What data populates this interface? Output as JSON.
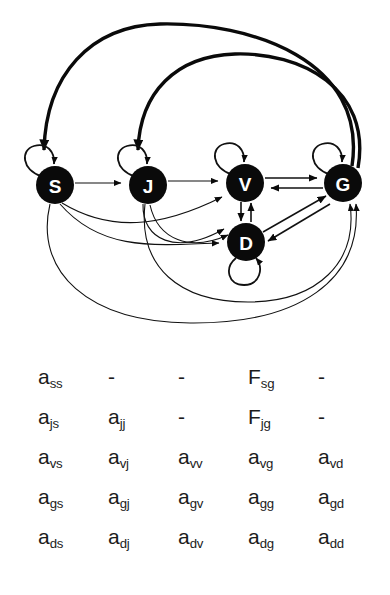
{
  "figure": {
    "caption": "",
    "graph": {
      "nodes": [
        {
          "id": "S",
          "label": "S",
          "cx": 55,
          "cy": 185,
          "r": 19
        },
        {
          "id": "J",
          "label": "J",
          "cx": 148,
          "cy": 185,
          "r": 19
        },
        {
          "id": "V",
          "label": "V",
          "cx": 245,
          "cy": 183,
          "r": 19
        },
        {
          "id": "G",
          "label": "G",
          "cx": 343,
          "cy": 183,
          "r": 19
        },
        {
          "id": "D",
          "label": "D",
          "cx": 246,
          "cy": 242,
          "r": 19
        }
      ],
      "self_loops": [
        {
          "node": "S",
          "position": "upper-left"
        },
        {
          "node": "J",
          "position": "upper-left"
        },
        {
          "node": "V",
          "position": "upper-left"
        },
        {
          "node": "G",
          "position": "upper-left"
        },
        {
          "node": "D",
          "position": "bottom"
        }
      ],
      "edges": [
        {
          "from": "S",
          "to": "J",
          "style": "straight",
          "weight": "thin"
        },
        {
          "from": "J",
          "to": "V",
          "style": "straight",
          "weight": "thin"
        },
        {
          "from": "S",
          "to": "V",
          "style": "curve",
          "weight": "thin"
        },
        {
          "from": "S",
          "to": "D",
          "style": "curve",
          "weight": "thin"
        },
        {
          "from": "J",
          "to": "D",
          "style": "curve",
          "weight": "thin"
        },
        {
          "from": "V",
          "to": "G",
          "style": "straight",
          "weight": "med"
        },
        {
          "from": "G",
          "to": "V",
          "style": "straight",
          "weight": "med"
        },
        {
          "from": "V",
          "to": "D",
          "style": "straight",
          "weight": "med"
        },
        {
          "from": "D",
          "to": "V",
          "style": "straight",
          "weight": "med"
        },
        {
          "from": "D",
          "to": "G",
          "style": "straight",
          "weight": "med"
        },
        {
          "from": "G",
          "to": "D",
          "style": "straight",
          "weight": "med"
        },
        {
          "from": "S",
          "to": "G",
          "style": "arc-bottom",
          "weight": "thin"
        },
        {
          "from": "J",
          "to": "G",
          "style": "arc-bottom",
          "weight": "thin"
        },
        {
          "from": "G",
          "to": "S",
          "style": "arc-top",
          "weight": "thick"
        },
        {
          "from": "G",
          "to": "J",
          "style": "arc-top",
          "weight": "thick"
        }
      ],
      "colors": {
        "node_fill": "#0a0a0a",
        "node_label": "#ffffff",
        "edge": "#111111",
        "background": "#ffffff"
      }
    },
    "matrix": {
      "rows": [
        [
          {
            "base": "a",
            "sub": "ss"
          },
          {
            "base": "-",
            "sub": ""
          },
          {
            "base": "-",
            "sub": ""
          },
          {
            "base": "F",
            "sub": "sg"
          },
          {
            "base": "-",
            "sub": ""
          }
        ],
        [
          {
            "base": "a",
            "sub": "js"
          },
          {
            "base": "a",
            "sub": "jj"
          },
          {
            "base": "-",
            "sub": ""
          },
          {
            "base": "F",
            "sub": "jg"
          },
          {
            "base": "-",
            "sub": ""
          }
        ],
        [
          {
            "base": "a",
            "sub": "vs"
          },
          {
            "base": "a",
            "sub": "vj"
          },
          {
            "base": "a",
            "sub": "vv"
          },
          {
            "base": "a",
            "sub": "vg"
          },
          {
            "base": "a",
            "sub": "vd"
          }
        ],
        [
          {
            "base": "a",
            "sub": "gs"
          },
          {
            "base": "a",
            "sub": "gj"
          },
          {
            "base": "a",
            "sub": "gv"
          },
          {
            "base": "a",
            "sub": "gg"
          },
          {
            "base": "a",
            "sub": "gd"
          }
        ],
        [
          {
            "base": "a",
            "sub": "ds"
          },
          {
            "base": "a",
            "sub": "dj"
          },
          {
            "base": "a",
            "sub": "dv"
          },
          {
            "base": "a",
            "sub": "dg"
          },
          {
            "base": "a",
            "sub": "dd"
          }
        ]
      ]
    }
  }
}
